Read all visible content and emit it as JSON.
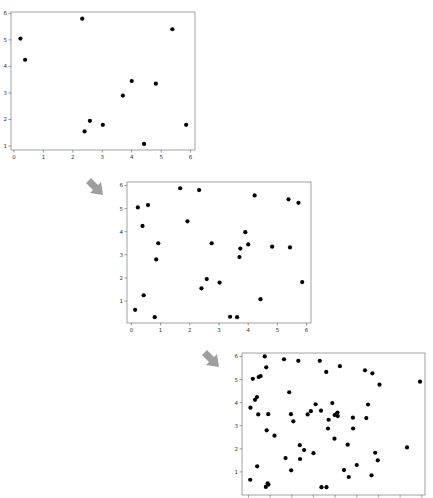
{
  "arrow": {
    "color": "#9e9e9e",
    "icon": "down-right-arrow-icon"
  },
  "chart_data": [
    {
      "type": "scatter",
      "title": "",
      "xlabel": "",
      "ylabel": "",
      "xlim": [
        -0.1,
        6.15
      ],
      "ylim": [
        0.85,
        6.05
      ],
      "xticks": [
        0,
        1,
        2,
        3,
        4,
        5,
        6
      ],
      "yticks": [
        1,
        2,
        3,
        4,
        5,
        6
      ],
      "grid": false,
      "marker_color": "#000000",
      "points": [
        [
          0.22,
          5.05
        ],
        [
          0.38,
          4.25
        ],
        [
          2.32,
          5.8
        ],
        [
          2.4,
          1.55
        ],
        [
          2.58,
          1.95
        ],
        [
          3.02,
          1.8
        ],
        [
          3.7,
          2.9
        ],
        [
          4.0,
          3.45
        ],
        [
          4.42,
          1.08
        ],
        [
          4.82,
          3.35
        ],
        [
          5.38,
          5.4
        ],
        [
          5.85,
          1.8
        ]
      ]
    },
    {
      "type": "scatter",
      "title": "",
      "xlabel": "",
      "ylabel": "",
      "xlim": [
        -0.15,
        6.15
      ],
      "ylim": [
        0.05,
        6.15
      ],
      "xticks": [
        0,
        1,
        2,
        3,
        4,
        5,
        6
      ],
      "yticks": [
        1,
        2,
        3,
        4,
        5,
        6
      ],
      "grid": false,
      "marker_color": "#000000",
      "points": [
        [
          0.13,
          0.62
        ],
        [
          0.22,
          5.05
        ],
        [
          0.38,
          4.25
        ],
        [
          0.42,
          1.25
        ],
        [
          0.57,
          5.15
        ],
        [
          0.8,
          0.3
        ],
        [
          0.85,
          2.8
        ],
        [
          0.92,
          3.5
        ],
        [
          1.67,
          5.88
        ],
        [
          1.92,
          4.45
        ],
        [
          2.32,
          5.8
        ],
        [
          2.4,
          1.55
        ],
        [
          2.58,
          1.95
        ],
        [
          2.75,
          3.5
        ],
        [
          3.02,
          1.8
        ],
        [
          3.38,
          0.32
        ],
        [
          3.62,
          0.3
        ],
        [
          3.7,
          2.9
        ],
        [
          3.73,
          3.27
        ],
        [
          3.9,
          3.98
        ],
        [
          4.0,
          3.45
        ],
        [
          4.22,
          5.57
        ],
        [
          4.42,
          1.08
        ],
        [
          4.82,
          3.35
        ],
        [
          5.38,
          5.4
        ],
        [
          5.43,
          3.32
        ],
        [
          5.72,
          5.25
        ],
        [
          5.85,
          1.82
        ]
      ]
    },
    {
      "type": "scatter",
      "title": "",
      "xlabel": "",
      "ylabel": "",
      "xlim": [
        -0.3,
        8.15
      ],
      "ylim": [
        0.0,
        6.15
      ],
      "xticks": [
        0,
        1,
        2,
        3,
        4,
        5,
        6,
        7,
        8
      ],
      "yticks": [
        1,
        2,
        3,
        4,
        5,
        6
      ],
      "grid": false,
      "marker_color": "#000000",
      "points": [
        [
          0.08,
          0.66
        ],
        [
          0.09,
          3.78
        ],
        [
          0.2,
          5.03
        ],
        [
          0.3,
          4.12
        ],
        [
          0.39,
          4.24
        ],
        [
          0.4,
          1.24
        ],
        [
          0.45,
          3.49
        ],
        [
          0.47,
          5.11
        ],
        [
          0.56,
          5.15
        ],
        [
          0.75,
          6.0
        ],
        [
          0.8,
          0.35
        ],
        [
          0.82,
          5.53
        ],
        [
          0.84,
          2.8
        ],
        [
          0.88,
          0.5
        ],
        [
          0.91,
          3.5
        ],
        [
          0.92,
          0.45
        ],
        [
          1.2,
          2.57
        ],
        [
          1.64,
          5.88
        ],
        [
          1.71,
          1.6
        ],
        [
          1.88,
          4.45
        ],
        [
          1.96,
          3.5
        ],
        [
          1.97,
          1.07
        ],
        [
          2.07,
          3.19
        ],
        [
          2.3,
          5.81
        ],
        [
          2.37,
          2.16
        ],
        [
          2.38,
          1.56
        ],
        [
          2.57,
          1.95
        ],
        [
          2.73,
          3.49
        ],
        [
          2.88,
          3.63
        ],
        [
          3.0,
          1.81
        ],
        [
          3.1,
          3.93
        ],
        [
          3.29,
          5.81
        ],
        [
          3.35,
          3.65
        ],
        [
          3.37,
          0.34
        ],
        [
          3.59,
          5.33
        ],
        [
          3.6,
          0.34
        ],
        [
          3.67,
          2.88
        ],
        [
          3.7,
          3.26
        ],
        [
          3.87,
          3.98
        ],
        [
          3.97,
          2.44
        ],
        [
          3.98,
          3.46
        ],
        [
          4.06,
          3.5
        ],
        [
          4.11,
          3.57
        ],
        [
          4.12,
          3.42
        ],
        [
          4.22,
          5.58
        ],
        [
          4.41,
          1.08
        ],
        [
          4.58,
          2.18
        ],
        [
          4.63,
          0.78
        ],
        [
          4.82,
          3.35
        ],
        [
          4.83,
          2.88
        ],
        [
          5.0,
          1.3
        ],
        [
          5.38,
          5.4
        ],
        [
          5.44,
          3.33
        ],
        [
          5.52,
          3.92
        ],
        [
          5.68,
          0.85
        ],
        [
          5.72,
          5.27
        ],
        [
          5.85,
          1.83
        ],
        [
          5.97,
          1.5
        ],
        [
          6.05,
          4.78
        ],
        [
          7.32,
          2.06
        ],
        [
          7.92,
          4.91
        ]
      ]
    }
  ],
  "panels": [
    {
      "id": "panel-1",
      "left": 0,
      "top": 4,
      "width": 198,
      "height": 160,
      "plot": {
        "x": 11,
        "y": 8,
        "w": 184,
        "h": 138
      },
      "show_x_labels": true
    },
    {
      "id": "panel-2",
      "left": 115,
      "top": 176,
      "width": 200,
      "height": 164,
      "plot": {
        "x": 12,
        "y": 6,
        "w": 184,
        "h": 141
      },
      "show_x_labels": true
    },
    {
      "id": "panel-3",
      "left": 228,
      "top": 349,
      "width": 205,
      "height": 149,
      "plot": {
        "x": 14,
        "y": 4,
        "w": 183,
        "h": 142
      },
      "show_x_labels": false
    }
  ],
  "arrows": [
    {
      "left": 84,
      "top": 176
    },
    {
      "left": 200,
      "top": 348
    }
  ]
}
